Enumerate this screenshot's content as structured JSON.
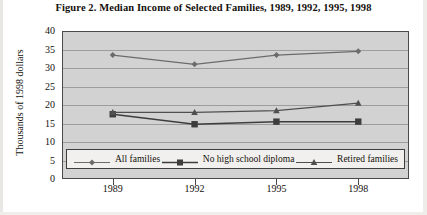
{
  "figure": {
    "title": "Figure 2.  Median Income of Selected Families, 1989, 1992, 1995, 1998",
    "bottom_caption": ""
  },
  "chart_data": {
    "type": "line",
    "title": "Figure 2.  Median Income of Selected Families, 1989, 1992, 1995, 1998",
    "xlabel": "",
    "ylabel": "Thousands of 1998 dollars",
    "categories": [
      "1989",
      "1992",
      "1995",
      "1998"
    ],
    "ylim": [
      0,
      40
    ],
    "yticks": [
      "0",
      "5",
      "10",
      "15",
      "20",
      "25",
      "30",
      "35",
      "40"
    ],
    "grid": true,
    "legend_position": "bottom-inside",
    "series": [
      {
        "name": "All families",
        "marker": "diamond",
        "color": "#6b6b6b",
        "values": [
          33.5,
          31.0,
          33.5,
          34.5
        ]
      },
      {
        "name": "No high school diploma",
        "marker": "square",
        "color": "#3d3d3d",
        "values": [
          17.5,
          14.8,
          15.5,
          15.5
        ]
      },
      {
        "name": "Retired families",
        "marker": "triangle",
        "color": "#4f4f4f",
        "values": [
          18.0,
          18.0,
          18.5,
          20.5
        ]
      }
    ]
  },
  "colors": {
    "plot_background": "#d2d2d2",
    "gridline": "#9d9d9d",
    "frame": "#4a4a4a",
    "legend_background": "#f2f0ee",
    "text": "#14100c"
  }
}
